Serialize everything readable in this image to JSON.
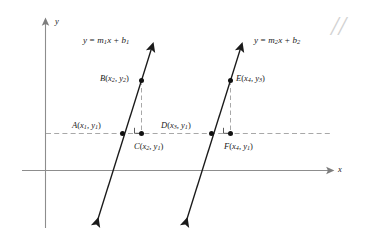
{
  "figure": {
    "axes": {
      "x_label": "x",
      "y_label": "y"
    },
    "lines": [
      {
        "id": "line-1",
        "equation_plain": "y = m1x + b1",
        "equation_parts": {
          "lhs": "y",
          "eq": " = ",
          "slope": "m",
          "slope_sub": "1",
          "var": "x",
          "plus": " + ",
          "intercept": "b",
          "intercept_sub": "1"
        }
      },
      {
        "id": "line-2",
        "equation_plain": "y = m2x + b2",
        "equation_parts": {
          "lhs": "y",
          "eq": " = ",
          "slope": "m",
          "slope_sub": "2",
          "var": "x",
          "plus": " + ",
          "intercept": "b",
          "intercept_sub": "2"
        }
      }
    ],
    "points": [
      {
        "id": "A",
        "name": "A",
        "x_var": "x",
        "x_sub": "1",
        "y_var": "y",
        "y_sub": "1",
        "label_plain": "A(x1, y1)"
      },
      {
        "id": "B",
        "name": "B",
        "x_var": "x",
        "x_sub": "2",
        "y_var": "y",
        "y_sub": "2",
        "label_plain": "B(x2, y2)"
      },
      {
        "id": "C",
        "name": "C",
        "x_var": "x",
        "x_sub": "2",
        "y_var": "y",
        "y_sub": "1",
        "label_plain": "C(x2, y1)"
      },
      {
        "id": "D",
        "name": "D",
        "x_var": "x",
        "x_sub": "3",
        "y_var": "y",
        "y_sub": "1",
        "label_plain": "D(x3, y1)"
      },
      {
        "id": "E",
        "name": "E",
        "x_var": "x",
        "x_sub": "4",
        "y_var": "y",
        "y_sub": "3",
        "label_plain": "E(x4, y3)"
      },
      {
        "id": "F",
        "name": "F",
        "x_var": "x",
        "x_sub": "4",
        "y_var": "y",
        "y_sub": "1",
        "label_plain": "F(x4, y1)"
      }
    ],
    "corner_mark": "//",
    "colors": {
      "axis": "#8d8d8d",
      "line": "#1a1a1a",
      "dashed": "#a8a8a8",
      "text": "#1a1a1a",
      "background": "#ffffff",
      "corner_mark": "#d2d2d2"
    }
  }
}
